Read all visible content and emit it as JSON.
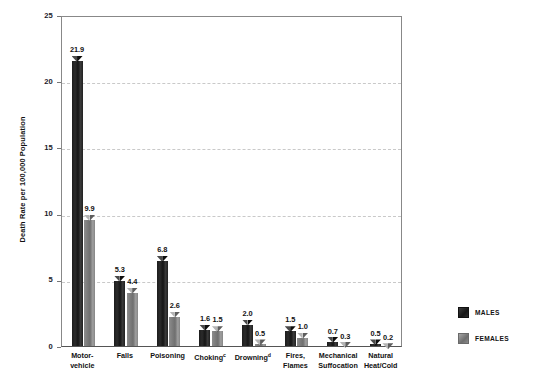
{
  "title_sliver": "",
  "axes": {
    "ylabel": "Death Rate per 100,000 Population",
    "yticks": [
      "0",
      "5",
      "10",
      "15",
      "20",
      "25"
    ]
  },
  "legend": {
    "items": [
      {
        "label": "MALES",
        "color": "#1c1c1c"
      },
      {
        "label": "FEMALES",
        "color": "#808080"
      }
    ]
  },
  "categories": [
    {
      "line1": "Motor-",
      "line2": "vehicle",
      "sup": ""
    },
    {
      "line1": "Falls",
      "line2": "",
      "sup": ""
    },
    {
      "line1": "Poisoning",
      "line2": "",
      "sup": ""
    },
    {
      "line1": "Choking",
      "line2": "",
      "sup": "c"
    },
    {
      "line1": "Drowning",
      "line2": "",
      "sup": "d"
    },
    {
      "line1": "Fires,",
      "line2": "Flames",
      "sup": ""
    },
    {
      "line1": "Mechanical",
      "line2": "Suffocation",
      "sup": ""
    },
    {
      "line1": "Natural",
      "line2": "Heat/Cold",
      "sup": ""
    }
  ],
  "values": {
    "males": [
      "21.9",
      "5.3",
      "6.8",
      "1.6",
      "2.0",
      "1.5",
      "0.7",
      "0.5"
    ],
    "females": [
      "9.9",
      "4.4",
      "2.6",
      "1.5",
      "0.5",
      "1.0",
      "0.3",
      "0.2"
    ]
  },
  "chart_data": {
    "type": "bar",
    "title": "",
    "xlabel": "",
    "ylabel": "Death Rate per 100,000 Population",
    "ylim": [
      0,
      25
    ],
    "yticks": [
      0,
      5,
      10,
      15,
      20,
      25
    ],
    "grid": "horizontal-dashed",
    "legend_position": "right",
    "categories": [
      "Motor-vehicle",
      "Falls",
      "Poisoning",
      "Choking",
      "Drowning",
      "Fires, Flames",
      "Mechanical Suffocation",
      "Natural Heat/Cold"
    ],
    "series": [
      {
        "name": "MALES",
        "color": "#1c1c1c",
        "values": [
          21.9,
          5.3,
          6.8,
          1.6,
          2.0,
          1.5,
          0.7,
          0.5
        ]
      },
      {
        "name": "FEMALES",
        "color": "#808080",
        "values": [
          9.9,
          4.4,
          2.6,
          1.5,
          0.5,
          1.0,
          0.3,
          0.2
        ]
      }
    ],
    "annotations": [
      "Choking category carries footnote marker c",
      "Drowning category carries footnote marker d"
    ]
  }
}
